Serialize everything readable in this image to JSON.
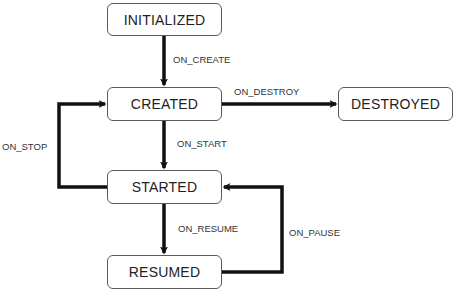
{
  "diagram": {
    "type": "state-machine",
    "colors": {
      "line": "#111111",
      "box_border": "#5a5a5a",
      "text": "#222222",
      "background": "#ffffff"
    },
    "states": {
      "initialized": "INITIALIZED",
      "created": "CREATED",
      "destroyed": "DESTROYED",
      "started": "STARTED",
      "resumed": "RESUMED"
    },
    "transitions": {
      "on_create": "ON_CREATE",
      "on_destroy": "ON_DESTROY",
      "on_start": "ON_START",
      "on_stop": "ON_STOP",
      "on_resume": "ON_RESUME",
      "on_pause": "ON_PAUSE"
    },
    "edges": [
      {
        "from": "INITIALIZED",
        "to": "CREATED",
        "label": "ON_CREATE"
      },
      {
        "from": "CREATED",
        "to": "DESTROYED",
        "label": "ON_DESTROY"
      },
      {
        "from": "CREATED",
        "to": "STARTED",
        "label": "ON_START"
      },
      {
        "from": "STARTED",
        "to": "CREATED",
        "label": "ON_STOP"
      },
      {
        "from": "STARTED",
        "to": "RESUMED",
        "label": "ON_RESUME"
      },
      {
        "from": "RESUMED",
        "to": "STARTED",
        "label": "ON_PAUSE"
      }
    ]
  }
}
